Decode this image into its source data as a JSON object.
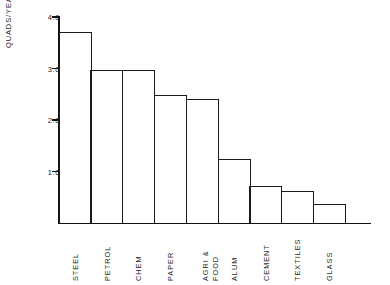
{
  "chart_data": {
    "type": "bar",
    "title": "",
    "subtitle": "",
    "xlabel": "",
    "ylabel": "QUADS/YEAR",
    "categories": [
      "STEEL",
      "PETROL",
      "CHEM",
      "PAPER",
      "AGRI &\nFOOD",
      "ALUM",
      "CEMENT",
      "TEXTILES",
      "GLASS"
    ],
    "values": [
      3.7,
      2.98,
      2.98,
      2.48,
      2.4,
      1.24,
      0.72,
      0.62,
      0.37
    ],
    "ylim": [
      0,
      4.0
    ],
    "yticks": [
      4.0,
      3.0,
      2.0,
      1.0
    ],
    "ytick_labels": [
      "4.0",
      "3.0",
      "2.0",
      "1.0"
    ],
    "grid": false,
    "legend": null,
    "series": [
      {
        "name": "Energy use",
        "values": [
          3.7,
          2.98,
          2.98,
          2.48,
          2.4,
          1.24,
          0.72,
          0.62,
          0.37
        ]
      }
    ],
    "colors": {
      "bar_fill": "#ffffff",
      "bar_stroke": "#1a1a1a",
      "axis": "#111111",
      "text": "#1f1f1f",
      "background": "#ffffff"
    }
  }
}
